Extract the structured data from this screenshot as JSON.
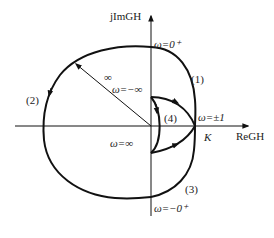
{
  "diagram": {
    "axes": {
      "x_label": "ReGH",
      "y_label": "jImGH"
    },
    "labels": {
      "omega_0_plus": "ω=0⁺",
      "omega_neg_0_plus": "ω=−0⁺",
      "omega_pm1": "ω=±1",
      "omega_neg_inf": "ω=−∞",
      "omega_inf": "ω=∞",
      "infinity_radius": "∞",
      "K": "K",
      "segment_1": "(1)",
      "segment_2": "(2)",
      "segment_3": "(3)",
      "segment_4": "(4)"
    },
    "colors": {
      "stroke": "#111111",
      "text": "#222222"
    }
  }
}
